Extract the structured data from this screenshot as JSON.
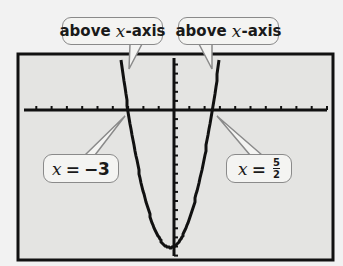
{
  "chart_data": {
    "type": "line",
    "title": "",
    "function": "y = 2x^2 + x - 15",
    "xlim": [
      -10,
      10.5
    ],
    "ylim": [
      -16.5,
      6.3
    ],
    "x_tick_step": 1,
    "y_tick_step": 1,
    "grid": false,
    "roots": [
      -3,
      2.5
    ],
    "vertex": [
      -0.25,
      -15.125
    ],
    "annotations": [
      {
        "text": "above x-axis",
        "points_to": "left branch above x-axis"
      },
      {
        "text": "above x-axis",
        "points_to": "right branch above x-axis"
      },
      {
        "text": "x = −3",
        "points_to": [
          -3,
          0
        ]
      },
      {
        "text": "x = 5/2",
        "points_to": [
          2.5,
          0
        ]
      }
    ]
  },
  "callouts": {
    "top_left": {
      "word": "above",
      "var": "x",
      "suffix": "-axis"
    },
    "top_right": {
      "word": "above",
      "var": "x",
      "suffix": "-axis"
    },
    "bottom_left": {
      "var": "x",
      "eq": "=",
      "value": "−3"
    },
    "bottom_right": {
      "var": "x",
      "eq": "=",
      "num": "5",
      "den": "2"
    }
  },
  "colors": {
    "screen_bg": "#e4e4e2",
    "frame": "#111111",
    "curve": "#111111",
    "callout_border": "#8a8a8a",
    "callout_bg": "#f4f4f2"
  }
}
